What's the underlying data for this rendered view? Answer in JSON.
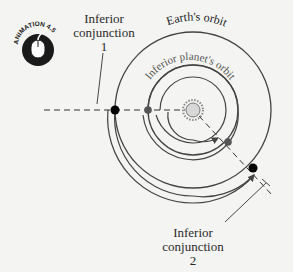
{
  "badge": {
    "label": "ANIMATION 4.5",
    "icon": "mouse-icon"
  },
  "labels": {
    "earth_orbit": "Earth's orbit",
    "planet_orbit": "Inferior planet's orbit",
    "conjunction_1": [
      "Inferior",
      "conjunction",
      "1"
    ],
    "conjunction_2": [
      "Inferior",
      "conjunction",
      "2"
    ]
  },
  "colors": {
    "background": "#f4f4f2",
    "orbit_line": "#444444",
    "earth": "#000000",
    "planet": "#555555",
    "sun_fill": "#d8d8d8"
  }
}
